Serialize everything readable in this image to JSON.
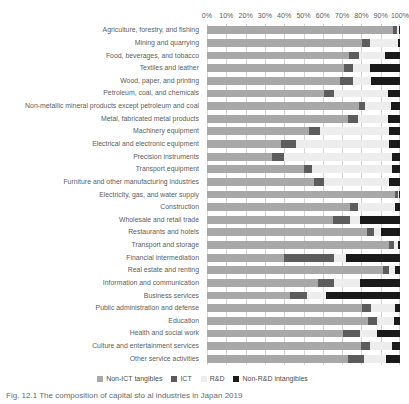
{
  "chart_data": {
    "type": "bar",
    "orientation": "horizontal",
    "stacked": true,
    "normalized_percent": true,
    "title": "",
    "subtitle": "",
    "xlabel": "",
    "ylabel": "",
    "xlim": [
      0,
      100
    ],
    "grid": true,
    "grid_axis": "x",
    "legend_position": "bottom",
    "tick_labels": [
      "0%",
      "10%",
      "20%",
      "30%",
      "40%",
      "50%",
      "60%",
      "70%",
      "80%",
      "90%",
      "100%"
    ],
    "tick_values": [
      0,
      10,
      20,
      30,
      40,
      50,
      60,
      70,
      80,
      90,
      100
    ],
    "categories": [
      "Agriculture, forestry, and fishing",
      "Mining and quarrying",
      "Food, beverages, and tobacco",
      "Textiles and leather",
      "Wood, paper, and printing",
      "Petroleum, coal, and chemicals",
      "Non-metallic mineral products except petroleum and coal",
      "Metal, fabricated metal products",
      "Machinery equipment",
      "Electrical and electronic equipment",
      "Precision instruments",
      "Transport equipment",
      "Furniture and other manufacturing industries",
      "Electricity, gas, and water supply",
      "Construction",
      "Wholesale and retail trade",
      "Restaurants and hotels",
      "Transport and storage",
      "Financial intermediation",
      "Real estate and renting",
      "Information and communication",
      "Business services",
      "Public administration and defense",
      "Education",
      "Health and social work",
      "Culture and entertainment services",
      "Other service activities"
    ],
    "series": [
      {
        "name": "Non-ICT tangibles",
        "color": "#a8a8a8",
        "values": [
          96.5,
          80.5,
          73.5,
          71.0,
          69.0,
          60.5,
          78.5,
          73.0,
          53.0,
          38.5,
          33.5,
          50.5,
          55.5,
          97.5,
          74.0,
          65.5,
          83.0,
          94.5,
          40.0,
          91.0,
          57.5,
          43.0,
          80.5,
          83.5,
          70.5,
          80.0,
          73.0
        ]
      },
      {
        "name": "ICT",
        "color": "#5c5c5c",
        "values": [
          2.0,
          4.0,
          5.5,
          4.5,
          6.5,
          5.5,
          3.5,
          5.0,
          5.5,
          7.5,
          6.5,
          4.0,
          5.0,
          1.5,
          4.5,
          8.5,
          3.5,
          2.5,
          26.0,
          3.5,
          8.5,
          9.0,
          4.5,
          4.5,
          9.0,
          4.5,
          8.5
        ]
      },
      {
        "name": "R&D",
        "color": "#ededed",
        "values": [
          1.0,
          14.5,
          13.0,
          9.0,
          9.5,
          28.0,
          13.5,
          16.0,
          36.0,
          48.5,
          56.0,
          41.5,
          34.0,
          0.5,
          19.0,
          5.5,
          3.5,
          2.0,
          6.0,
          3.0,
          13.5,
          9.5,
          12.5,
          9.0,
          8.5,
          11.5,
          11.5
        ]
      },
      {
        "name": "Non-R&D intangibles",
        "color": "#1a1a1a",
        "values": [
          0.5,
          1.0,
          8.0,
          15.5,
          15.0,
          6.0,
          4.5,
          6.0,
          5.5,
          5.5,
          4.0,
          4.0,
          5.5,
          0.5,
          2.5,
          20.5,
          10.0,
          1.0,
          28.0,
          2.5,
          20.5,
          38.5,
          2.5,
          3.0,
          12.0,
          4.0,
          7.0
        ]
      }
    ]
  },
  "legend": {
    "items": [
      {
        "label": "Non-ICT tangibles",
        "color": "#a8a8a8"
      },
      {
        "label": "ICT",
        "color": "#5c5c5c"
      },
      {
        "label": "R&D",
        "color": "#ededed"
      },
      {
        "label": "Non-R&D intangibles",
        "color": "#1a1a1a"
      }
    ]
  },
  "caption": {
    "text": "Fig.  12.1  The composition of capital  sto al  industries  in  Japan  2019"
  }
}
